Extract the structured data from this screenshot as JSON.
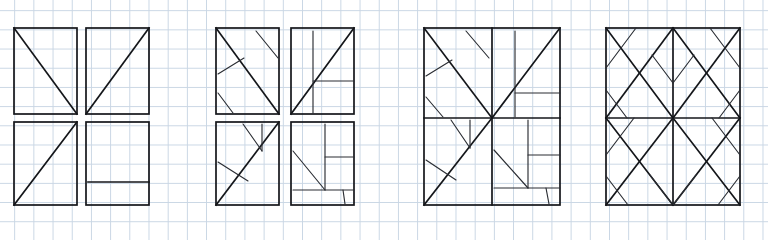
{
  "canvas": {
    "width": 768,
    "height": 240,
    "background_color": "#ffffff",
    "grid": {
      "visible": true,
      "cell_size": 19.2,
      "color": "#c9d6e4",
      "description": "light blue graph-paper grid covering whole sheet"
    },
    "ink_color": "#14161a",
    "description": "Hand-drawn style line diagram: four rectangular figures in a row, each built from a 2x2 arrangement of quadrants filled with diagonal and straight line subdivisions."
  },
  "figures": [
    {
      "id": "figure-1",
      "label": "Figure 1 - four separated quadrants, simple diagonals",
      "bbox": [
        14,
        28,
        152,
        205
      ],
      "quadrants": [
        {
          "name": "top-left",
          "contents": [
            "diagonal top-left to bottom-right"
          ]
        },
        {
          "name": "top-right",
          "contents": [
            "diagonal bottom-left to top-right"
          ]
        },
        {
          "name": "bottom-left",
          "contents": [
            "diagonal bottom-left to top-right"
          ]
        },
        {
          "name": "bottom-right",
          "contents": [
            "horizontal line near bottom"
          ]
        }
      ]
    },
    {
      "id": "figure-2",
      "label": "Figure 2 - four separated quadrants with extra branch lines",
      "bbox": [
        216,
        28,
        354,
        205
      ],
      "quadrants": [
        {
          "name": "top-left",
          "contents": [
            "main diagonal top-left to bottom-right",
            "short parallel line upper-right",
            "short branch mid-left",
            "short branch lower-left"
          ]
        },
        {
          "name": "top-right",
          "contents": [
            "main diagonal bottom-left to top-right",
            "vertical line",
            "horizontal line"
          ]
        },
        {
          "name": "bottom-left",
          "contents": [
            "main diagonal bottom-left to top-right",
            "two short branches upper",
            "one short branch lower-left"
          ]
        },
        {
          "name": "bottom-right",
          "contents": [
            "vertical line",
            "horizontal stub right",
            "diagonal to center",
            "horizontal line near bottom",
            "short vertical tick"
          ]
        }
      ]
    },
    {
      "id": "figure-3",
      "label": "Figure 3 - single merged rectangle, quadrants joined at center",
      "bbox": [
        424,
        28,
        560,
        205
      ],
      "quadrants": [
        {
          "name": "top-left",
          "contents": [
            "main diagonal top-left to center",
            "short parallel line upper-right",
            "short branch mid-left",
            "short branch lower-left"
          ]
        },
        {
          "name": "top-right",
          "contents": [
            "main diagonal center to top-right",
            "vertical line",
            "horizontal line"
          ]
        },
        {
          "name": "bottom-left",
          "contents": [
            "main diagonal bottom-left to center",
            "two short branches upper",
            "one short branch lower-left"
          ]
        },
        {
          "name": "bottom-right",
          "contents": [
            "vertical line",
            "horizontal stub right",
            "diagonal to center-left",
            "horizontal line near bottom",
            "short vertical tick"
          ]
        }
      ]
    },
    {
      "id": "figure-4",
      "label": "Figure 4 - merged rectangle with symmetric hatched chevrons",
      "bbox": [
        606,
        28,
        740,
        205
      ],
      "quadrants": [
        {
          "name": "top-left",
          "contents": [
            "main diagonal top-left to bottom-right",
            "anti-diagonal bottom-left to top-right",
            "three parallel hatch lines"
          ]
        },
        {
          "name": "top-right",
          "contents": [
            "main diagonal bottom-left to top-right",
            "anti-diagonal top-left to bottom-right",
            "three parallel hatch lines"
          ]
        },
        {
          "name": "bottom-left",
          "contents": [
            "main diagonal top-left to bottom-right",
            "anti-diagonal bottom-left to top-right",
            "three parallel hatch lines"
          ]
        },
        {
          "name": "bottom-right",
          "contents": [
            "main diagonal bottom-left to top-right",
            "anti-diagonal top-left to bottom-right",
            "three parallel hatch lines"
          ]
        }
      ]
    }
  ]
}
